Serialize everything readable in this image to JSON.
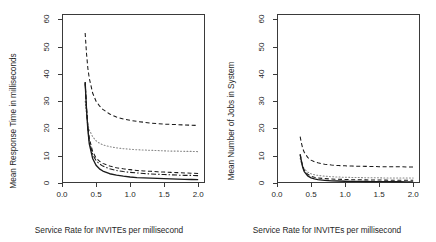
{
  "figure": {
    "panel_count": 2,
    "background": "#ffffff",
    "foreground": "#1a1a1a"
  },
  "chart_data": [
    {
      "type": "line",
      "panel": "left",
      "title": "",
      "xlabel": "Service Rate for INVITEs per millisecond",
      "ylabel": "Mean Response Time in milliseconds",
      "xlim": [
        0.0,
        2.1
      ],
      "ylim": [
        0,
        62
      ],
      "xticks": [
        "0.0",
        "0.5",
        "1.0",
        "1.5",
        "2.0"
      ],
      "xtick_values": [
        0.0,
        0.5,
        1.0,
        1.5,
        2.0
      ],
      "yticks": [
        "0",
        "10",
        "20",
        "30",
        "40",
        "50",
        "60"
      ],
      "ytick_values": [
        0,
        10,
        20,
        30,
        40,
        50,
        60
      ],
      "grid": false,
      "legend": "none",
      "x": [
        0.34,
        0.36,
        0.38,
        0.4,
        0.45,
        0.5,
        0.55,
        0.6,
        0.7,
        0.8,
        0.9,
        1.0,
        1.1,
        1.2,
        1.3,
        1.4,
        1.5,
        1.6,
        1.7,
        1.8,
        1.9,
        2.0
      ],
      "series": [
        {
          "name": "curve-dashed-upper",
          "style": "dashed",
          "color": "#1a1a1a",
          "values": [
            55.0,
            47.5,
            42.0,
            38.5,
            33.0,
            30.0,
            28.3,
            27.0,
            25.3,
            24.2,
            23.5,
            23.0,
            22.6,
            22.3,
            22.0,
            21.8,
            21.6,
            21.5,
            21.4,
            21.3,
            21.2,
            21.1
          ]
        },
        {
          "name": "curve-dotted-middle",
          "style": "dotted",
          "color": "#8a8a8a",
          "values": [
            30.0,
            25.0,
            21.5,
            19.5,
            17.0,
            15.5,
            14.6,
            14.0,
            13.3,
            12.9,
            12.6,
            12.4,
            12.2,
            12.1,
            12.0,
            11.9,
            11.8,
            11.7,
            11.7,
            11.6,
            11.6,
            11.5
          ]
        },
        {
          "name": "curve-dashed-lower",
          "style": "dashed",
          "color": "#1a1a1a",
          "values": [
            37.0,
            28.0,
            21.0,
            16.5,
            11.5,
            9.2,
            8.0,
            7.2,
            6.2,
            5.6,
            5.2,
            4.9,
            4.6,
            4.4,
            4.3,
            4.1,
            4.0,
            3.9,
            3.8,
            3.7,
            3.6,
            3.5
          ]
        },
        {
          "name": "curve-dashdot-lower",
          "style": "dashdot",
          "color": "#1a1a1a",
          "values": [
            36.5,
            27.0,
            20.0,
            15.5,
            10.5,
            8.2,
            7.0,
            6.2,
            5.2,
            4.6,
            4.2,
            3.9,
            3.7,
            3.5,
            3.3,
            3.2,
            3.1,
            3.0,
            2.9,
            2.8,
            2.8,
            2.7
          ]
        },
        {
          "name": "curve-solid-lowest",
          "style": "solid",
          "color": "#1a1a1a",
          "values": [
            37.0,
            27.0,
            19.5,
            14.5,
            9.0,
            6.5,
            5.2,
            4.4,
            3.4,
            2.9,
            2.5,
            2.2,
            2.0,
            1.9,
            1.8,
            1.7,
            1.6,
            1.5,
            1.4,
            1.35,
            1.3,
            1.25
          ]
        }
      ]
    },
    {
      "type": "line",
      "panel": "right",
      "title": "",
      "xlabel": "Service Rate for INVITEs per millisecond",
      "ylabel": "Mean Number of Jobs in System",
      "xlim": [
        0.0,
        2.1
      ],
      "ylim": [
        0,
        62
      ],
      "xticks": [
        "0.0",
        "0.5",
        "1.0",
        "1.5",
        "2.0"
      ],
      "xtick_values": [
        0.0,
        0.5,
        1.0,
        1.5,
        2.0
      ],
      "yticks": [
        "0",
        "10",
        "20",
        "30",
        "40",
        "50",
        "60"
      ],
      "ytick_values": [
        0,
        10,
        20,
        30,
        40,
        50,
        60
      ],
      "grid": false,
      "legend": "none",
      "x": [
        0.34,
        0.36,
        0.38,
        0.4,
        0.45,
        0.5,
        0.55,
        0.6,
        0.7,
        0.8,
        0.9,
        1.0,
        1.1,
        1.2,
        1.3,
        1.4,
        1.5,
        1.6,
        1.7,
        1.8,
        1.9,
        2.0
      ],
      "series": [
        {
          "name": "curve-dashed-upper",
          "style": "dashed",
          "color": "#1a1a1a",
          "values": [
            17.0,
            14.5,
            12.5,
            11.3,
            9.4,
            8.4,
            7.8,
            7.4,
            6.9,
            6.6,
            6.4,
            6.3,
            6.2,
            6.15,
            6.1,
            6.05,
            6.0,
            6.0,
            5.95,
            5.95,
            5.9,
            5.9
          ]
        },
        {
          "name": "curve-dotted-middle",
          "style": "dotted",
          "color": "#8a8a8a",
          "values": [
            9.0,
            7.2,
            6.0,
            5.2,
            4.0,
            3.4,
            3.0,
            2.8,
            2.5,
            2.3,
            2.2,
            2.1,
            2.05,
            2.0,
            1.95,
            1.9,
            1.9,
            1.85,
            1.85,
            1.8,
            1.8,
            1.8
          ]
        },
        {
          "name": "curve-dashed-lower",
          "style": "dashed",
          "color": "#1a1a1a",
          "values": [
            10.5,
            8.0,
            6.0,
            4.7,
            3.2,
            2.5,
            2.1,
            1.85,
            1.6,
            1.45,
            1.35,
            1.3,
            1.2,
            1.18,
            1.15,
            1.1,
            1.08,
            1.05,
            1.02,
            1.0,
            1.0,
            0.98
          ]
        },
        {
          "name": "curve-solid-lowest",
          "style": "solid",
          "color": "#1a1a1a",
          "values": [
            10.5,
            7.8,
            5.6,
            4.2,
            2.6,
            1.9,
            1.5,
            1.25,
            0.95,
            0.8,
            0.72,
            0.65,
            0.6,
            0.57,
            0.54,
            0.52,
            0.5,
            0.48,
            0.47,
            0.45,
            0.44,
            0.43
          ]
        }
      ]
    }
  ]
}
